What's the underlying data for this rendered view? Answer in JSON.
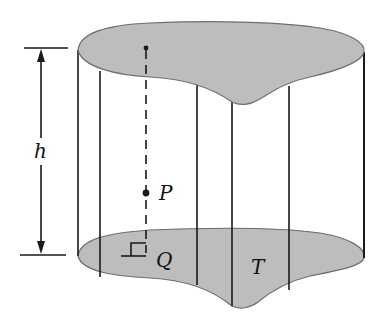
{
  "figure": {
    "labels": {
      "height": "h",
      "point_p": "P",
      "point_q": "Q",
      "base_region": "T"
    },
    "colors": {
      "fill": "#bdbdbd",
      "stroke": "#1a1a1a",
      "outline": "#6e6e6e",
      "background": "#ffffff"
    }
  }
}
